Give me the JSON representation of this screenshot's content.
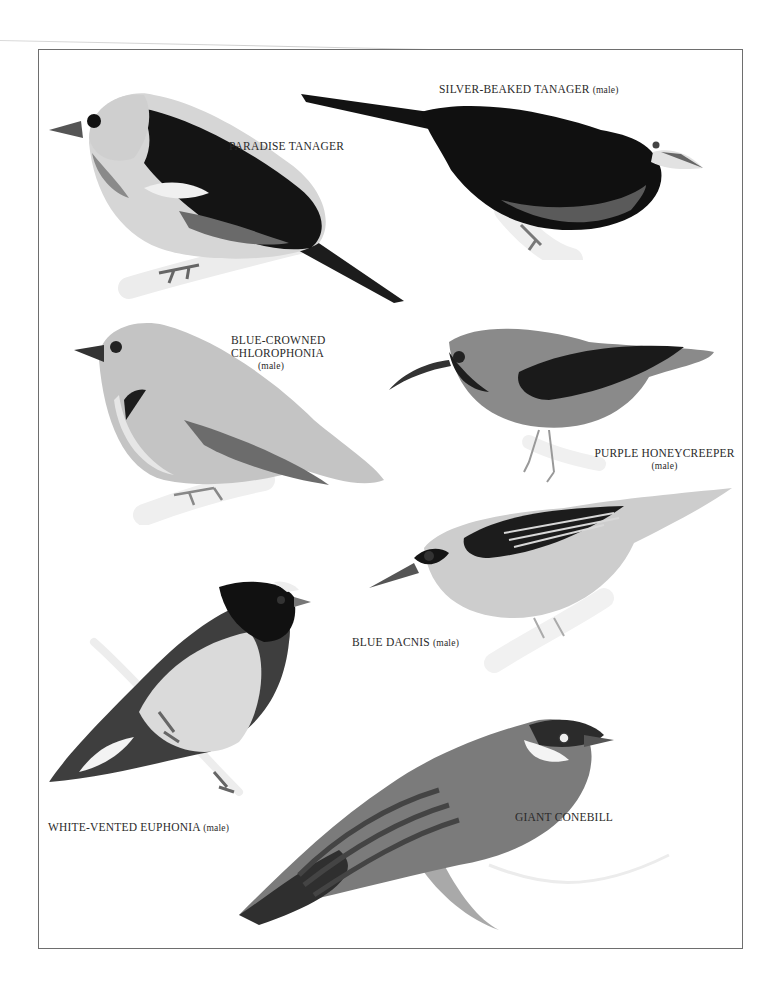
{
  "plate": {
    "border_color": "#6e6e6e",
    "background": "#ffffff",
    "birds": [
      {
        "id": "paradise-tanager",
        "name": "PARADISE TANAGER",
        "sex": ""
      },
      {
        "id": "silver-beaked-tanager",
        "name": "SILVER-BEAKED TANAGER",
        "sex": "(male)"
      },
      {
        "id": "blue-crowned-chlorophonia",
        "name_line1": "BLUE-CROWNED",
        "name_line2": "CHLOROPHONIA",
        "sex": "(male)"
      },
      {
        "id": "purple-honeycreeper",
        "name": "PURPLE HONEYCREEPER",
        "sex": "(male)"
      },
      {
        "id": "blue-dacnis",
        "name": "BLUE DACNIS",
        "sex": "(male)"
      },
      {
        "id": "white-vented-euphonia",
        "name": "WHITE-VENTED EUPHONIA",
        "sex": "(male)"
      },
      {
        "id": "giant-conebill",
        "name": "GIANT CONEBILL",
        "sex": ""
      }
    ]
  }
}
